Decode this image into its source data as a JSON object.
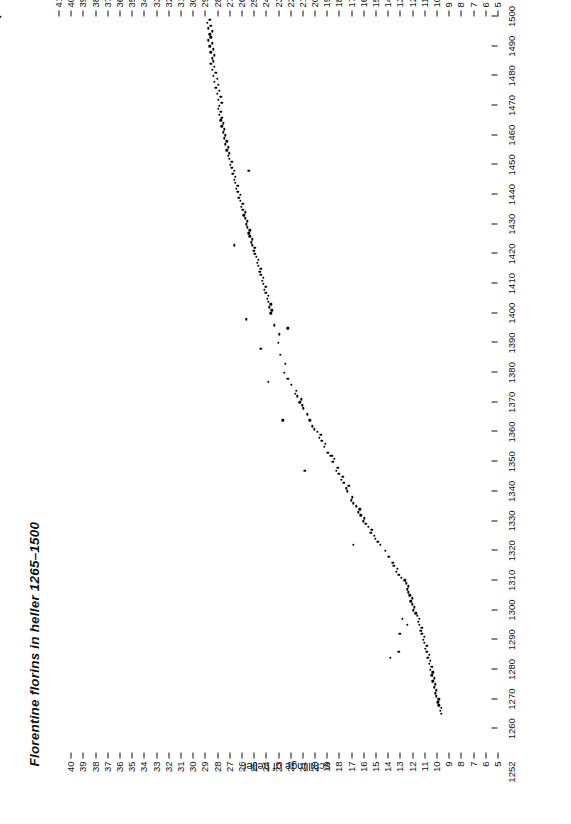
{
  "chart_data": {
    "type": "scatter",
    "title": "Florentine florins in heller 1265–1500",
    "xlabel": "",
    "ylabel": "schillinge of heller",
    "xlim": [
      1252,
      1500
    ],
    "ylim": [
      5,
      41
    ],
    "grid": false,
    "legend": null,
    "marker_color": "#000000",
    "background_color": "#ffffff",
    "x_ticks": [
      1252,
      1260,
      1270,
      1280,
      1290,
      1300,
      1310,
      1320,
      1330,
      1340,
      1350,
      1360,
      1370,
      1380,
      1390,
      1400,
      1410,
      1420,
      1430,
      1440,
      1450,
      1460,
      1470,
      1480,
      1490,
      1500
    ],
    "x_tick_labels": [
      "1252",
      "1260",
      "1270",
      "1280",
      "1290",
      "1300",
      "1310",
      "1320",
      "1330",
      "1340",
      "1350",
      "1360",
      "1370",
      "1380",
      "1390",
      "1400",
      "1410",
      "1420",
      "1430",
      "1440",
      "1450",
      "1460",
      "1470",
      "1480",
      "1490",
      "1500"
    ],
    "y_ticks_left": [
      5,
      6,
      7,
      8,
      9,
      10,
      11,
      12,
      13,
      14,
      15,
      16,
      17,
      18,
      19,
      20,
      21,
      22,
      23,
      24,
      25,
      26,
      27,
      28,
      29,
      30,
      31,
      32,
      33,
      34,
      35,
      36,
      37,
      38,
      39,
      40
    ],
    "y_ticks_right": [
      5,
      6,
      7,
      8,
      9,
      10,
      11,
      12,
      13,
      14,
      15,
      16,
      17,
      18,
      19,
      20,
      21,
      22,
      23,
      24,
      25,
      26,
      27,
      28,
      29,
      30,
      31,
      32,
      33,
      34,
      35,
      36,
      37,
      38,
      39,
      40,
      41
    ],
    "x": [
      1265,
      1266,
      1267,
      1268,
      1269,
      1270,
      1271,
      1272,
      1273,
      1274,
      1275,
      1276,
      1277,
      1278,
      1279,
      1280,
      1281,
      1282,
      1283,
      1284,
      1285,
      1286,
      1287,
      1288,
      1289,
      1290,
      1291,
      1292,
      1293,
      1294,
      1295,
      1296,
      1297,
      1298,
      1299,
      1300,
      1301,
      1302,
      1303,
      1304,
      1305,
      1306,
      1307,
      1308,
      1309,
      1310,
      1286,
      1292,
      1297,
      1311,
      1312,
      1313,
      1314,
      1315,
      1316,
      1318,
      1320,
      1322,
      1323,
      1324,
      1325,
      1326,
      1327,
      1328,
      1329,
      1330,
      1331,
      1332,
      1333,
      1334,
      1335,
      1336,
      1337,
      1338,
      1340,
      1341,
      1342,
      1343,
      1344,
      1345,
      1346,
      1347,
      1348,
      1350,
      1351,
      1352,
      1353,
      1355,
      1356,
      1357,
      1358,
      1359,
      1360,
      1361,
      1362,
      1364,
      1366,
      1368,
      1370,
      1371,
      1372,
      1373,
      1374,
      1376,
      1378,
      1380,
      1383,
      1386,
      1390,
      1393,
      1396,
      1400,
      1401,
      1402,
      1403,
      1404,
      1405,
      1406,
      1407,
      1408,
      1409,
      1410,
      1411,
      1412,
      1413,
      1414,
      1415,
      1416,
      1417,
      1418,
      1419,
      1420,
      1421,
      1422,
      1423,
      1424,
      1425,
      1426,
      1427,
      1428,
      1429,
      1430,
      1431,
      1432,
      1433,
      1434,
      1435,
      1436,
      1437,
      1438,
      1439,
      1440,
      1441,
      1442,
      1443,
      1444,
      1445,
      1446,
      1447,
      1448,
      1449,
      1450,
      1451,
      1452,
      1453,
      1454,
      1455,
      1456,
      1457,
      1458,
      1459,
      1460,
      1461,
      1462,
      1463,
      1464,
      1465,
      1466,
      1467,
      1468,
      1469,
      1470,
      1471,
      1472,
      1473,
      1474,
      1475,
      1476,
      1477,
      1478,
      1479,
      1480,
      1481,
      1482,
      1483,
      1484,
      1485,
      1486,
      1487,
      1488,
      1489,
      1490,
      1491,
      1492,
      1493,
      1494,
      1495,
      1496,
      1497,
      1498,
      1499,
      1500
    ],
    "y": [
      9.6,
      9.7,
      9.6,
      9.8,
      9.9,
      9.8,
      10.0,
      10.1,
      10.0,
      10.2,
      10.1,
      10.3,
      10.2,
      10.4,
      10.3,
      10.5,
      10.4,
      10.6,
      10.5,
      10.7,
      10.6,
      10.8,
      10.9,
      10.8,
      11.0,
      11.1,
      11.0,
      11.2,
      11.3,
      11.2,
      11.4,
      11.5,
      11.4,
      11.6,
      11.7,
      11.9,
      11.8,
      12.0,
      12.1,
      12.0,
      12.2,
      12.3,
      12.4,
      12.3,
      12.5,
      12.6,
      13.1,
      13.0,
      12.8,
      12.9,
      13.1,
      13.3,
      13.2,
      13.5,
      13.6,
      13.9,
      14.2,
      14.6,
      14.8,
      15.0,
      15.1,
      15.4,
      15.3,
      15.6,
      15.8,
      16.0,
      15.9,
      16.2,
      16.4,
      16.3,
      16.6,
      16.8,
      17.0,
      16.9,
      17.3,
      17.4,
      17.2,
      17.6,
      17.8,
      17.7,
      18.0,
      18.2,
      18.1,
      18.5,
      18.4,
      18.7,
      18.9,
      19.2,
      19.1,
      19.4,
      19.6,
      19.5,
      19.8,
      20.0,
      20.2,
      20.4,
      20.6,
      20.9,
      21.2,
      21.1,
      21.4,
      21.6,
      21.5,
      21.9,
      22.2,
      22.5,
      22.4,
      22.8,
      23.0,
      22.9,
      23.3,
      23.6,
      23.5,
      23.7,
      23.6,
      23.8,
      23.9,
      23.8,
      24.0,
      24.1,
      24.0,
      24.2,
      24.3,
      24.2,
      24.4,
      24.5,
      24.4,
      24.6,
      24.7,
      24.6,
      24.8,
      24.9,
      25.0,
      24.9,
      25.1,
      25.2,
      25.1,
      25.3,
      25.4,
      25.3,
      25.5,
      25.6,
      25.5,
      25.7,
      25.8,
      25.7,
      25.9,
      26.0,
      25.9,
      26.1,
      26.2,
      26.1,
      26.3,
      26.4,
      26.3,
      26.5,
      26.6,
      26.5,
      26.7,
      26.6,
      26.8,
      26.9,
      26.8,
      27.0,
      27.1,
      27.0,
      27.2,
      27.1,
      27.3,
      27.2,
      27.4,
      27.3,
      27.5,
      27.4,
      27.6,
      27.5,
      27.7,
      27.6,
      27.8,
      27.7,
      27.9,
      27.8,
      27.6,
      27.9,
      27.7,
      28.0,
      27.8,
      28.1,
      27.9,
      28.2,
      28.0,
      28.3,
      28.1,
      28.4,
      28.2,
      28.5,
      28.3,
      28.4,
      28.2,
      28.5,
      28.3,
      28.6,
      28.4,
      28.7,
      28.5,
      28.6,
      28.4,
      28.7,
      28.5,
      28.8,
      28.6
    ],
    "outliers_x": [
      1284,
      1295,
      1322,
      1347,
      1352,
      1364,
      1369,
      1377,
      1388,
      1395,
      1398,
      1423,
      1448
    ],
    "outliers_y": [
      13.8,
      12.4,
      16.8,
      20.8,
      18.6,
      22.6,
      21.0,
      23.8,
      24.4,
      22.2,
      25.6,
      26.6,
      25.4
    ]
  }
}
